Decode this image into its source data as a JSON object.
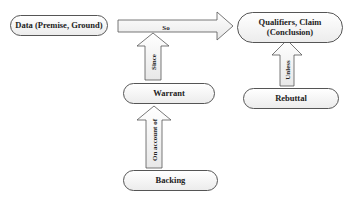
{
  "diagram": {
    "nodes": {
      "data": {
        "label": "Data (Premise, Ground)"
      },
      "claim": {
        "line1": "Qualifiers, Claim",
        "line2": "(Conclusion)"
      },
      "warrant": {
        "label": "Warrant"
      },
      "rebuttal": {
        "label": "Rebuttal"
      },
      "backing": {
        "label": "Backing"
      }
    },
    "arrows": {
      "so": {
        "label": "So",
        "from": "data",
        "to": "claim"
      },
      "since": {
        "label": "Since",
        "from": "warrant",
        "to": "so"
      },
      "unless": {
        "label": "Unless",
        "from": "rebuttal",
        "to": "claim"
      },
      "on_account_of": {
        "label": "On account of",
        "from": "backing",
        "to": "warrant"
      }
    },
    "colors": {
      "stroke": "#555555",
      "fill": "#f2f2f2",
      "text": "#222222"
    }
  }
}
